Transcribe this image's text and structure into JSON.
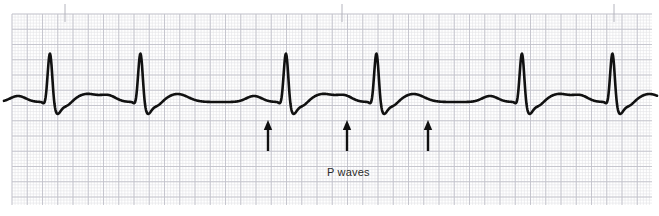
{
  "figure": {
    "type": "ecg-rhythm-strip",
    "width": 659,
    "height": 216,
    "background_color": "#ffffff",
    "trace_color": "#111111",
    "grid": {
      "area": {
        "x": 12,
        "y": 14,
        "width": 640,
        "height": 191
      },
      "minor_spacing_px": 3.05,
      "major_spacing_px": 15.25,
      "minor_color": "#e2e2e6",
      "major_color": "#c2c2cb",
      "minor_width_px": 0.6,
      "major_width_px": 0.9
    },
    "time_ticks": {
      "label": "3-second-markers",
      "color": "#b4b4bd",
      "y_top": 4,
      "y_bottom": 22,
      "x_positions": [
        65,
        342,
        614
      ]
    }
  },
  "annotations": {
    "p_wave_label": {
      "text": "P waves",
      "x": 327,
      "y": 166,
      "color": "#2b2b2b",
      "font_size_px": 11
    },
    "arrows": [
      {
        "name": "p-wave-arrow-1",
        "x": 268,
        "tip_y": 120,
        "tail_y": 151
      },
      {
        "name": "p-wave-arrow-2",
        "x": 347,
        "tip_y": 120,
        "tail_y": 151
      },
      {
        "name": "p-wave-arrow-3",
        "x": 428,
        "tip_y": 120,
        "tail_y": 151
      }
    ],
    "arrow_color": "#111111"
  },
  "chart_data": {
    "type": "line",
    "title": "",
    "xlabel": "",
    "ylabel": "",
    "series_name": "ECG lead II rhythm strip",
    "baseline_y_px": 102,
    "r_peak_y_px": 52,
    "trace_start_x": 4,
    "trace_end_x": 657,
    "beat_interval_px": 90.5,
    "r_peak_x_positions": [
      50,
      140.5,
      286,
      376.5,
      522,
      612.5
    ],
    "p_wave_x_positions": [
      18,
      108.5,
      254,
      344.5,
      490,
      580.5
    ],
    "t_wave_x_positions": [
      75,
      165.5,
      311,
      401.5,
      547,
      637.5
    ],
    "annotated_p_waves_x": [
      268,
      347,
      428
    ],
    "beat_morphology": {
      "p_amplitude_px": 6,
      "p_half_width_px": 11,
      "q_depth_px": 3,
      "q_offset_px": -5,
      "r_rise_px": 50,
      "r_half_width_px": 3.2,
      "s_depth_px": 11,
      "s_offset_px": 7,
      "s_recovery_px": 16,
      "t_amplitude_px": 8,
      "t_half_width_px": 15,
      "t_offset_px": 25
    }
  }
}
